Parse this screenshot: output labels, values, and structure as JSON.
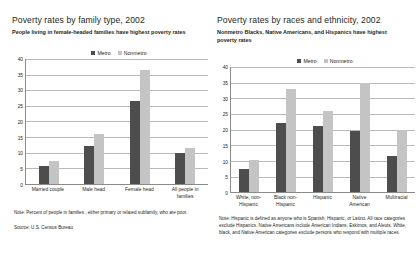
{
  "legend": {
    "metro_label": "Metro",
    "nonmetro_label": "Nonmetro",
    "metro_color": "#4d4d4d",
    "nonmetro_color": "#c4c4c4"
  },
  "left": {
    "title": "Poverty rates by family type, 2002",
    "subtitle": "People living in female-headed families have highest poverty rates",
    "note": "Note: Percent of people in families , either primary or related subfamily, who are poor.",
    "source": "Source: U.S. Census Bureau"
  },
  "right": {
    "title": "Poverty rates by races and ethnicity, 2002",
    "subtitle": "Nonmetro Blacks, Native Americans, and Hispanics have highest poverty rates",
    "note": "Note: Hispanic is defined as anyone who is Spanish, Hispanic, or Latino. All race categories exclude Hispanics. Native Americans include American Indians, Eskimos, and Aleuts. White, black, and Native American categories exclude persons who respond with multiple races."
  },
  "chart_data": [
    {
      "type": "bar",
      "title": "Poverty rates by family type, 2002",
      "subtitle": "People living in female-headed families have highest poverty rates",
      "xlabel": "",
      "ylabel": "",
      "ylim": [
        0,
        40
      ],
      "yticks": [
        0,
        5,
        10,
        15,
        20,
        25,
        30,
        35,
        40
      ],
      "grid": true,
      "legend_position": "top-center",
      "categories": [
        "Married couple",
        "Male head",
        "Female head",
        "All people in families"
      ],
      "series": [
        {
          "name": "Metro",
          "color": "#4d4d4d",
          "values": [
            5.8,
            12.0,
            26.5,
            10.0
          ]
        },
        {
          "name": "Nonmetro",
          "color": "#c4c4c4",
          "values": [
            7.4,
            16.0,
            36.3,
            11.4
          ]
        }
      ],
      "note": "Note: Percent of people in families , either primary or related subfamily, who are poor.",
      "source": "Source: U.S. Census Bureau"
    },
    {
      "type": "bar",
      "title": "Poverty rates by races and ethnicity, 2002",
      "subtitle": "Nonmetro Blacks, Native Americans, and Hispanics have highest poverty rates",
      "xlabel": "",
      "ylabel": "",
      "ylim": [
        0,
        40
      ],
      "yticks": [
        0,
        5,
        10,
        15,
        20,
        25,
        30,
        35,
        40
      ],
      "grid": true,
      "legend_position": "top-center",
      "categories": [
        "White, non-Hispanic",
        "Black non-Hispanic",
        "Hispanic",
        "Native American",
        "Multiracial"
      ],
      "series": [
        {
          "name": "Metro",
          "color": "#4d4d4d",
          "values": [
            7.4,
            22.0,
            21.1,
            19.6,
            11.5
          ]
        },
        {
          "name": "Nonmetro",
          "color": "#c4c4c4",
          "values": [
            10.3,
            33.0,
            26.0,
            35.0,
            20.0
          ]
        }
      ],
      "note": "Note: Hispanic is defined as anyone who is Spanish, Hispanic, or Latino. All race categories exclude Hispanics. Native Americans include American Indians, Eskimos, and Aleuts. White, black, and Native American categories exclude persons who respond with multiple races."
    }
  ]
}
